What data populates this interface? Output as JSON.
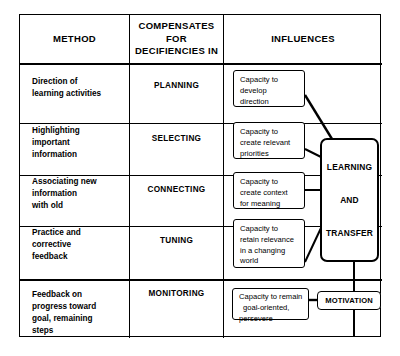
{
  "diagram": {
    "colors": {
      "line": "#000000",
      "background": "#ffffff",
      "text": "#000000"
    },
    "headers": {
      "method": "METHOD",
      "compensates_line1": "COMPENSATES",
      "compensates_line2": "FOR",
      "compensates_line3": "DECIFIENCIES IN",
      "influences": "INFLUENCES"
    },
    "rows": [
      {
        "method_line1": "Direction of",
        "method_line2": "learning activities",
        "compensates": "PLANNING",
        "influence_line1": "Capacity to",
        "influence_line2": "develop",
        "influence_line3": "direction",
        "influence_line4": ""
      },
      {
        "method_line1": "Highlighting",
        "method_line2": "important",
        "method_line3": "information",
        "compensates": "SELECTING",
        "influence_line1": "Capacity to",
        "influence_line2": "create relevant",
        "influence_line3": "priorities",
        "influence_line4": ""
      },
      {
        "method_line1": "Associating new",
        "method_line2": "information",
        "method_line3": "with old",
        "compensates": "CONNECTING",
        "influence_line1": "Capacity to",
        "influence_line2": "create context",
        "influence_line3": "for meaning",
        "influence_line4": ""
      },
      {
        "method_line1": "Practice and",
        "method_line2": "corrective",
        "method_line3": "feedback",
        "compensates": "TUNING",
        "influence_line1": "Capacity to",
        "influence_line2": "retain relevance",
        "influence_line3": "in a changing",
        "influence_line4": "world"
      },
      {
        "method_line1": "Feedback on",
        "method_line2": "progress toward",
        "method_line3": "goal, remaining",
        "method_line4": "steps",
        "compensates": "MONITORING",
        "influence_line1": "Capacity to remain",
        "influence_line2": "goal-oriented,",
        "influence_line3": "persevere",
        "influence_line4": ""
      }
    ],
    "outcome_box": {
      "line1": "LEARNING",
      "line2": "AND",
      "line3": "TRANSFER"
    },
    "motivation_box": {
      "label": "MOTIVATION"
    }
  }
}
